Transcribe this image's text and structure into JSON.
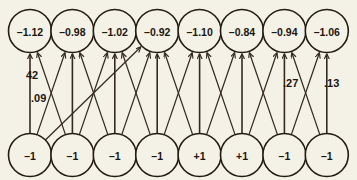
{
  "diagram": {
    "background_color": "#f4f1e6",
    "line_color": "#332b20",
    "text_color": "#1b1610",
    "layout": {
      "top_row_y": 31,
      "bottom_row_y": 155,
      "first_center_x": 30,
      "spacing_x": 42.4,
      "node_radius": 21.5
    },
    "top_layer": {
      "name": "output-layer",
      "nodes": [
        {
          "id": "top-1",
          "label": "–1.12",
          "value": -1.12
        },
        {
          "id": "top-2",
          "label": "–0.98",
          "value": -0.98
        },
        {
          "id": "top-3",
          "label": "–1.02",
          "value": -1.02
        },
        {
          "id": "top-4",
          "label": "–0.92",
          "value": -0.92
        },
        {
          "id": "top-5",
          "label": "–1.10",
          "value": -1.1
        },
        {
          "id": "top-6",
          "label": "–0.84",
          "value": -0.84
        },
        {
          "id": "top-7",
          "label": "–0.94",
          "value": -0.94
        },
        {
          "id": "top-8",
          "label": "–1.06",
          "value": -1.06
        }
      ]
    },
    "bottom_layer": {
      "name": "input-layer",
      "nodes": [
        {
          "id": "bot-1",
          "label": "–1",
          "value": -1
        },
        {
          "id": "bot-2",
          "label": "–1",
          "value": -1
        },
        {
          "id": "bot-3",
          "label": "–1",
          "value": -1
        },
        {
          "id": "bot-4",
          "label": "–1",
          "value": -1
        },
        {
          "id": "bot-5",
          "label": "+1",
          "value": 1
        },
        {
          "id": "bot-6",
          "label": "+1",
          "value": 1
        },
        {
          "id": "bot-7",
          "label": "–1",
          "value": -1
        },
        {
          "id": "bot-8",
          "label": "–1",
          "value": -1
        }
      ]
    },
    "weight_labels": [
      {
        "id": "w-vertical-1",
        "text": "42",
        "x": 26,
        "y": 75
      },
      {
        "id": "w-diagonal-1-4",
        "text": ".09",
        "x": 31,
        "y": 98
      },
      {
        "id": "w-vertical-7",
        "text": ".27",
        "x": 283,
        "y": 83
      },
      {
        "id": "w-vertical-8",
        "text": ".13",
        "x": 324,
        "y": 83
      }
    ],
    "edges": [
      {
        "from": 1,
        "to": 1,
        "kind": "vertical"
      },
      {
        "from": 2,
        "to": 2,
        "kind": "vertical"
      },
      {
        "from": 3,
        "to": 3,
        "kind": "vertical"
      },
      {
        "from": 4,
        "to": 4,
        "kind": "vertical"
      },
      {
        "from": 5,
        "to": 5,
        "kind": "vertical"
      },
      {
        "from": 6,
        "to": 6,
        "kind": "vertical"
      },
      {
        "from": 7,
        "to": 7,
        "kind": "vertical"
      },
      {
        "from": 8,
        "to": 8,
        "kind": "vertical"
      },
      {
        "from": 1,
        "to": 2,
        "kind": "diagonal"
      },
      {
        "from": 2,
        "to": 1,
        "kind": "diagonal"
      },
      {
        "from": 2,
        "to": 3,
        "kind": "diagonal"
      },
      {
        "from": 3,
        "to": 2,
        "kind": "diagonal"
      },
      {
        "from": 3,
        "to": 4,
        "kind": "diagonal"
      },
      {
        "from": 4,
        "to": 3,
        "kind": "diagonal"
      },
      {
        "from": 4,
        "to": 5,
        "kind": "diagonal"
      },
      {
        "from": 5,
        "to": 4,
        "kind": "diagonal"
      },
      {
        "from": 5,
        "to": 6,
        "kind": "diagonal"
      },
      {
        "from": 6,
        "to": 5,
        "kind": "diagonal"
      },
      {
        "from": 6,
        "to": 7,
        "kind": "diagonal"
      },
      {
        "from": 7,
        "to": 6,
        "kind": "diagonal"
      },
      {
        "from": 7,
        "to": 8,
        "kind": "diagonal"
      },
      {
        "from": 8,
        "to": 7,
        "kind": "diagonal"
      },
      {
        "from": 1,
        "to": 4,
        "kind": "long-diagonal"
      }
    ]
  }
}
